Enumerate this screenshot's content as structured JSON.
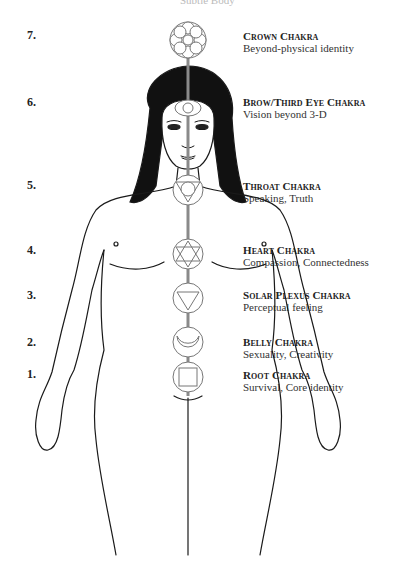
{
  "header": {
    "title": "Subtle Body"
  },
  "chakras": [
    {
      "number": "7.",
      "name": "Crown Chakra",
      "description": "Beyond-physical identity"
    },
    {
      "number": "6.",
      "name": "Brow/Third Eye Chakra",
      "description": "Vision beyond 3-D"
    },
    {
      "number": "5.",
      "name": "Throat Chakra",
      "description": "Speaking, Truth"
    },
    {
      "number": "4.",
      "name": "Heart Chakra",
      "description": "Compassion, Connectedness"
    },
    {
      "number": "3.",
      "name": "Solar Plexus Chakra",
      "description": "Perceptual feeling"
    },
    {
      "number": "2.",
      "name": "Belly Chakra",
      "description": "Sexuality, Creativity"
    },
    {
      "number": "1.",
      "name": "Root Chakra",
      "description": "Survival, Core identity"
    }
  ],
  "colors": {
    "ink": "#1a1a1a",
    "chakra_line": "#8a8a8a",
    "background": "#ffffff"
  }
}
